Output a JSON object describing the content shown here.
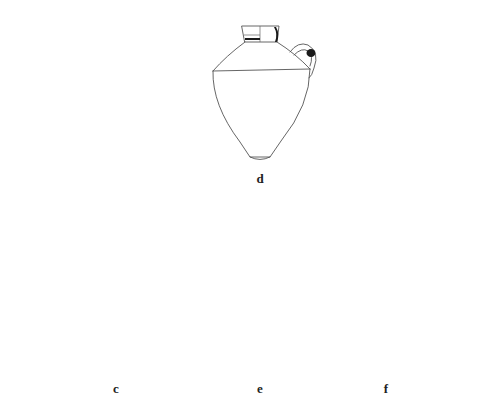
{
  "figure": {
    "vessels": [
      {
        "id": "d",
        "label": "d",
        "type": "one-handled jug",
        "label_pos": {
          "x": 260,
          "y": 171
        }
      },
      {
        "id": "c",
        "label": "c",
        "type": "two-handled amphora",
        "label_pos": {
          "x": 116,
          "y": 381
        }
      },
      {
        "id": "e",
        "label": "e",
        "type": "one-handled jug",
        "label_pos": {
          "x": 260,
          "y": 381
        }
      },
      {
        "id": "f",
        "label": "f",
        "type": "two-handled amphora",
        "label_pos": {
          "x": 386,
          "y": 381
        }
      }
    ],
    "colors": {
      "line": "#555555",
      "section_fill": "#1a1a1a",
      "background": "#ffffff"
    }
  }
}
